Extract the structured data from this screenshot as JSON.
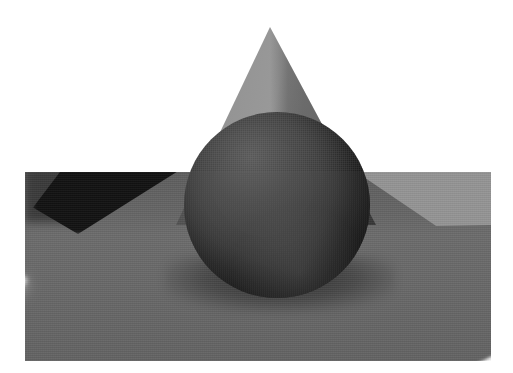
{
  "image": {
    "title": "Ray-traced grayscale scene: sphere, cone and caustic",
    "alt_text": "A dark matte sphere resting on a gray floor in front of a gray cone, with a bright white curved caustic light streak sweeping across the floor",
    "style": "grayscale 3D render",
    "canvas": {
      "width_px": 513,
      "height_px": 373,
      "background_color": "#ffffff"
    },
    "render_frame": {
      "left_px": 25,
      "top_px": 172,
      "width_px": 466,
      "height_px": 189,
      "ground_color": "#6e6e6e",
      "ground_far_color": "#5e5e5e"
    }
  },
  "objects": [
    {
      "name": "cone",
      "label": "Cone",
      "apex_x_px": 270,
      "apex_y_px": 27,
      "base_left_x_px": 176,
      "base_right_x_px": 376,
      "base_y_px": 225,
      "fill_color": "#999999",
      "shade_color": "#6d6d6d"
    },
    {
      "name": "sphere",
      "label": "Sphere",
      "center_x_px": 277,
      "center_y_px": 205,
      "radius_px": 93,
      "highlight_color": "#585858",
      "core_color": "#1f1f1f",
      "terminator_color": "#121212"
    },
    {
      "name": "ground-plane",
      "label": "Ground plane",
      "fill_color": "#6e6e6e"
    },
    {
      "name": "caustic-arc",
      "label": "Caustic light arc",
      "fill_color": "#fbfbfb",
      "glow_color": "#e6e6e6"
    },
    {
      "name": "shadow-wedge",
      "label": "Shadow wedge",
      "fill_color": "#121212"
    },
    {
      "name": "light-wedge",
      "label": "Light wedge",
      "fill_color": "#949494"
    }
  ],
  "palette": {
    "white": "#ffffff",
    "caustic_white": "#fbfbfb",
    "light_gray": "#949494",
    "cone_gray": "#999999",
    "mid_gray": "#6e6e6e",
    "far_gray": "#5e5e5e",
    "sphere_gray": "#3d3d3d",
    "dark": "#1f1f1f",
    "black": "#121212"
  }
}
